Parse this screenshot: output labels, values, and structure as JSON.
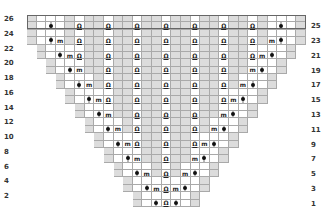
{
  "chart_title": "",
  "legend": {
    "dot": "dot-stitch",
    "m": "m",
    "yarnover": "O"
  },
  "grid": {
    "columns": 29,
    "rows": 26,
    "highlighted_rows": [
      25,
      26
    ],
    "colors": {
      "gray": "#dcdcdc",
      "white": "#ffffff",
      "line": "#a9a9a9",
      "symbol": "#111111"
    }
  },
  "labels": {
    "left": [
      "26",
      "24",
      "22",
      "20",
      "18",
      "16",
      "14",
      "12",
      "10",
      "8",
      "6",
      "4",
      "2"
    ],
    "right": [
      "25",
      "23",
      "21",
      "19",
      "17",
      "15",
      "13",
      "11",
      "9",
      "7",
      "5",
      "3",
      "1"
    ]
  },
  "symbols": {
    "m": "m",
    "yarnover": "Ω"
  }
}
